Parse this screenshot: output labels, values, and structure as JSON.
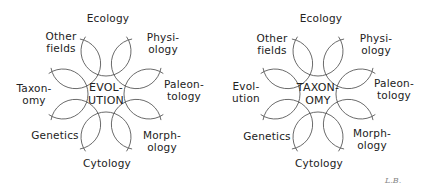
{
  "diagrams": [
    {
      "center_label": "EVOL-\nUTION",
      "labels": [
        {
          "text": "Ecology",
          "x": 108,
          "y": 18
        },
        {
          "text": "Physi-\nology",
          "x": 163,
          "y": 43
        },
        {
          "text": "Paleon-\ntology",
          "x": 184,
          "y": 90
        },
        {
          "text": "Morph-\nology",
          "x": 162,
          "y": 141
        },
        {
          "text": "Cytology",
          "x": 107,
          "y": 163
        },
        {
          "text": "Genetics",
          "x": 55,
          "y": 135
        },
        {
          "text": "Taxon-\nomy",
          "x": 34,
          "y": 94
        },
        {
          "text": "Other\nfields",
          "x": 61,
          "y": 42
        }
      ]
    },
    {
      "center_label": "TAXON-\nOMY",
      "labels": [
        {
          "text": "Ecology",
          "x": 108,
          "y": 18
        },
        {
          "text": "Physi-\nology",
          "x": 163,
          "y": 44
        },
        {
          "text": "Paleon-\ntology",
          "x": 181,
          "y": 89
        },
        {
          "text": "Morph-\nology",
          "x": 159,
          "y": 139
        },
        {
          "text": "Cytology",
          "x": 106,
          "y": 163
        },
        {
          "text": "Genetics",
          "x": 54,
          "y": 136
        },
        {
          "text": "Evol-\nution",
          "x": 33,
          "y": 92
        },
        {
          "text": "Other\nfields",
          "x": 59,
          "y": 44
        }
      ]
    }
  ],
  "signature": "L.B."
}
